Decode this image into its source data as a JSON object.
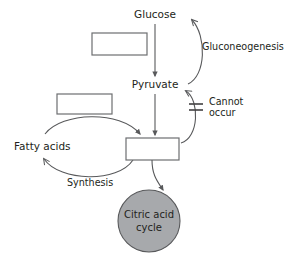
{
  "diagram": {
    "background_color": "#ffffff",
    "line_color": "#58595b",
    "box_fill": "#ffffff",
    "box_stroke": "#6d6e71",
    "circle_fill": "#a7a9ac",
    "circle_stroke": "#58595b",
    "text_color": "#231f20"
  },
  "nodes": {
    "glucose": {
      "label": "Glucose",
      "x": 155,
      "y": 18
    },
    "pyruvate": {
      "label": "Pyruvate",
      "x": 155,
      "y": 88
    },
    "citric_acid_cycle": {
      "line1": "Citric acid",
      "line2": "cycle",
      "cx": 149,
      "cy": 221,
      "r": 31
    },
    "fatty_acids": {
      "label": "Fatty acids",
      "x": 47,
      "y": 146
    }
  },
  "blank_boxes": [
    {
      "name": "blank-box-top",
      "value": "",
      "x": 92,
      "y": 33,
      "width": 55,
      "height": 22
    },
    {
      "name": "blank-box-middle-left",
      "value": "",
      "x": 57,
      "y": 94,
      "width": 55,
      "height": 20
    },
    {
      "name": "blank-box-center",
      "value": "",
      "x": 126,
      "y": 138,
      "width": 53,
      "height": 22
    }
  ],
  "edges": {
    "gluconeogenesis": {
      "label": "Gluconeogenesis",
      "label_x": 202,
      "label_y": 50,
      "direction": "pyruvate-to-glucose"
    },
    "cannot_occur": {
      "label_line1": "Cannot",
      "label_line2": "occur",
      "label_x": 209,
      "label_y": 106,
      "blocked": true,
      "direction": "center-box-to-pyruvate"
    },
    "synthesis": {
      "label": "Synthesis",
      "label_x": 67,
      "label_y": 186,
      "direction": "center-box-to-fatty-acids"
    },
    "glucose_to_pyruvate": {
      "direction": "down"
    },
    "pyruvate_to_center_box": {
      "direction": "down"
    },
    "center_box_to_cycle": {
      "direction": "down"
    },
    "fatty_acids_to_center_box": {
      "direction": "right"
    }
  }
}
